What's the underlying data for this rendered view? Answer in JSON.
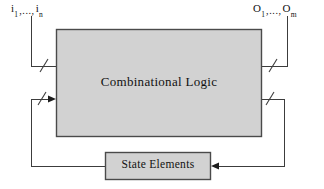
{
  "diagram": {
    "inputs": {
      "name": "input-bus-label",
      "base": "i",
      "first_sub": "1",
      "dots": ",...,",
      "last_sub": "n",
      "text": "i1,..., in"
    },
    "outputs": {
      "name": "output-bus-label",
      "base": "O",
      "first_sub": "1",
      "dots": ",...,",
      "last_sub": "m",
      "text": "O1,..., Om"
    },
    "blocks": [
      {
        "id": "combinational-logic",
        "label": "Combinational Logic",
        "fill": "#d2d2d2",
        "stroke": "#4a4a4a",
        "x": 56,
        "y": 29,
        "w": 206,
        "h": 108
      },
      {
        "id": "state-elements",
        "label": "State Elements",
        "fill": "#d2d2d2",
        "stroke": "#4a4a4a",
        "x": 105,
        "y": 152,
        "w": 106,
        "h": 28
      }
    ],
    "wires": [
      {
        "id": "input-bus-wire",
        "label": "input bus into combinational logic",
        "slash": true
      },
      {
        "id": "output-bus-wire",
        "label": "output bus from combinational logic",
        "slash": true
      },
      {
        "id": "state-feedback-in-wire",
        "label": "state elements to combinational logic",
        "slash": true,
        "arrow": true
      },
      {
        "id": "state-feedback-out-wire",
        "label": "combinational logic to state elements",
        "slash": true,
        "arrow": true
      }
    ],
    "colors": {
      "line": "#3c3c3c",
      "box_fill": "#d2d2d2",
      "box_stroke": "#4a4a4a",
      "text": "#111111",
      "background": "#ffffff"
    }
  }
}
